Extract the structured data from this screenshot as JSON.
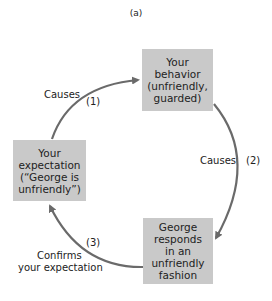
{
  "title": "(a)",
  "nodes": {
    "behavior": {
      "lines": [
        "Your",
        "behavior",
        "(unfriendly,",
        "guarded)"
      ]
    },
    "expectation": {
      "lines": [
        "Your",
        "expectation",
        "(“George is",
        "unfriendly”)"
      ]
    },
    "response": {
      "lines": [
        "George",
        "responds",
        "in an",
        "unfriendly",
        "fashion"
      ]
    }
  },
  "edges": {
    "e1": {
      "label": "Causes",
      "number": "(1)"
    },
    "e2": {
      "label": "Causes",
      "number": "(2)"
    },
    "e3": {
      "label_line1": "Confirms",
      "label_line2": "your expectation",
      "number": "(3)"
    }
  },
  "colors": {
    "box": "#c9c9c9",
    "arrow": "#6a6a6a"
  }
}
